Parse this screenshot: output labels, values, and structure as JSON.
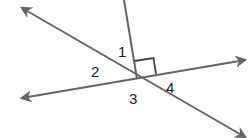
{
  "diagram": {
    "type": "geometry-angles",
    "colors": {
      "line": "#666666",
      "label": "#222222",
      "background": "#ffffff"
    },
    "intersection": {
      "x": 137,
      "y": 79
    },
    "lines": [
      {
        "name": "line-a",
        "from": [
          22,
          8
        ],
        "to": [
          245,
          137
        ],
        "arrows": "both"
      },
      {
        "name": "line-b",
        "from": [
          22,
          98
        ],
        "to": [
          245,
          60
        ],
        "arrows": "both"
      },
      {
        "name": "ray-c",
        "from": [
          137,
          79
        ],
        "to": [
          124,
          0
        ],
        "arrows": "none"
      }
    ],
    "right_angle_marker": {
      "between": [
        "ray-c",
        "line-b"
      ]
    },
    "labels": [
      {
        "id": "angle-1",
        "text": "1",
        "x": 118,
        "y": 57
      },
      {
        "id": "angle-2",
        "text": "2",
        "x": 91,
        "y": 77
      },
      {
        "id": "angle-3",
        "text": "3",
        "x": 129,
        "y": 104
      },
      {
        "id": "angle-4",
        "text": "4",
        "x": 166,
        "y": 93
      }
    ]
  }
}
